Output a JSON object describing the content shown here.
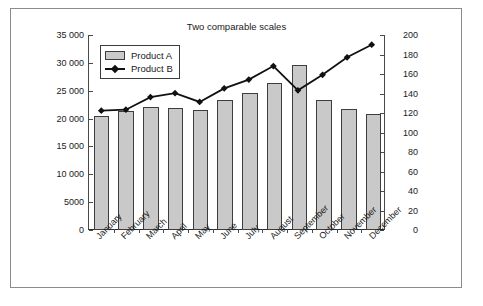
{
  "chart_data": {
    "type": "bar",
    "title": "Two comparable scales",
    "xlabel": "",
    "ylabel": "",
    "grid": false,
    "legend_position": "top-left-inside",
    "categories": [
      "January",
      "February",
      "March",
      "April",
      "May",
      "June",
      "July",
      "August",
      "September",
      "October",
      "November",
      "December"
    ],
    "series": [
      {
        "name": "Product A",
        "type": "bar",
        "axis": "left",
        "color": "#c9c9c9",
        "values": [
          20400,
          21300,
          22000,
          21900,
          21600,
          23400,
          24600,
          26300,
          29700,
          23300,
          21700,
          20900
        ]
      },
      {
        "name": "Product B",
        "type": "line",
        "axis": "right",
        "color": "#111111",
        "marker": "diamond",
        "values": [
          122,
          123,
          136,
          140,
          131,
          145,
          154,
          168,
          143,
          159,
          177,
          190
        ]
      }
    ],
    "left_axis": {
      "min": 0,
      "max": 35000,
      "step": 5000,
      "tick_labels": [
        "0",
        "5000",
        "10 000",
        "15 000",
        "20 000",
        "25 000",
        "30 000",
        "35 000"
      ],
      "tick_values": [
        0,
        5000,
        10000,
        15000,
        20000,
        25000,
        30000,
        35000
      ]
    },
    "right_axis": {
      "min": 0,
      "max": 200,
      "step": 20,
      "tick_labels": [
        "0",
        "20",
        "40",
        "60",
        "80",
        "100",
        "120",
        "140",
        "160",
        "180",
        "200"
      ],
      "tick_values": [
        0,
        20,
        40,
        60,
        80,
        100,
        120,
        140,
        160,
        180,
        200
      ]
    }
  },
  "legend": {
    "entries": [
      {
        "label": "Product A",
        "style": "swatch"
      },
      {
        "label": "Product B",
        "style": "line-marker"
      }
    ]
  },
  "colors": {
    "bar_fill": "#c9c9c9",
    "bar_stroke": "#3d3d3d",
    "line": "#111111",
    "axis": "#4a4a4a",
    "frame": "#8a8a90",
    "background": "#ffffff",
    "text": "#1a1a1a"
  }
}
